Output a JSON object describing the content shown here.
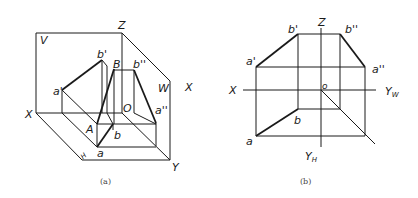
{
  "figure_a": {
    "caption": "(a)",
    "plane_labels": {
      "v": "V",
      "w": "W",
      "h": "H"
    },
    "axis_labels": {
      "z": "Z",
      "x_left": "X",
      "x_right": "X",
      "y": "Y",
      "origin": "O"
    },
    "point_labels": {
      "a_prime": "a'",
      "b_prime": "b'",
      "B": "B",
      "b_double_prime": "b''",
      "a_double_prime": "a''",
      "A": "A",
      "a": "a",
      "b": "b"
    }
  },
  "figure_b": {
    "caption": "(b)",
    "axis_labels": {
      "z": "Z",
      "x": "X",
      "yw": "Y",
      "yw_sub": "W",
      "yh": "Y",
      "yh_sub": "H",
      "origin": "o"
    },
    "point_labels": {
      "a_prime": "a'",
      "b_prime": "b'",
      "b_double_prime": "b''",
      "a_double_prime": "a''",
      "a": "a",
      "b": "b"
    }
  },
  "colors": {
    "line": "#1a1a1a",
    "background": "#ffffff",
    "caption": "#444444"
  }
}
